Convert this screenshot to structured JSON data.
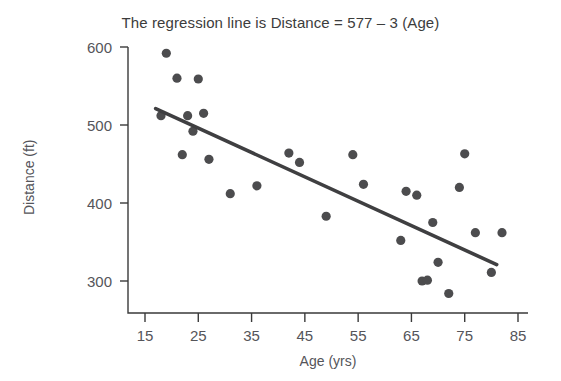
{
  "chart_data": {
    "type": "scatter",
    "title": "The regression line is Distance = 577 – 3 (Age)",
    "xlabel": "Age (yrs)",
    "ylabel": "Distance (ft)",
    "xlim": [
      10,
      85
    ],
    "ylim": [
      272,
      610
    ],
    "xticks": [
      15,
      25,
      35,
      45,
      55,
      65,
      75,
      85
    ],
    "yticks": [
      300,
      400,
      500,
      600
    ],
    "grid": false,
    "legend": null,
    "marker_color": "#4c4c4e",
    "line_color": "#3f3f41",
    "points": [
      {
        "x": 18,
        "y": 512
      },
      {
        "x": 19,
        "y": 592
      },
      {
        "x": 21,
        "y": 560
      },
      {
        "x": 22,
        "y": 462
      },
      {
        "x": 23,
        "y": 512
      },
      {
        "x": 24,
        "y": 492
      },
      {
        "x": 25,
        "y": 559
      },
      {
        "x": 26,
        "y": 515
      },
      {
        "x": 27,
        "y": 456
      },
      {
        "x": 31,
        "y": 412
      },
      {
        "x": 36,
        "y": 422
      },
      {
        "x": 42,
        "y": 464
      },
      {
        "x": 44,
        "y": 452
      },
      {
        "x": 49,
        "y": 383
      },
      {
        "x": 54,
        "y": 462
      },
      {
        "x": 56,
        "y": 424
      },
      {
        "x": 63,
        "y": 352
      },
      {
        "x": 64,
        "y": 415
      },
      {
        "x": 66,
        "y": 410
      },
      {
        "x": 67,
        "y": 300
      },
      {
        "x": 68,
        "y": 301
      },
      {
        "x": 69,
        "y": 375
      },
      {
        "x": 70,
        "y": 324
      },
      {
        "x": 72,
        "y": 284
      },
      {
        "x": 74,
        "y": 420
      },
      {
        "x": 75,
        "y": 463
      },
      {
        "x": 77,
        "y": 362
      },
      {
        "x": 80,
        "y": 311
      },
      {
        "x": 82,
        "y": 362
      }
    ],
    "regression": {
      "equation": "Distance = 577 – 3 (Age)",
      "intercept": 577,
      "slope": -3,
      "x_start": 17,
      "x_end": 81,
      "y_start": 521,
      "y_end": 321
    }
  }
}
